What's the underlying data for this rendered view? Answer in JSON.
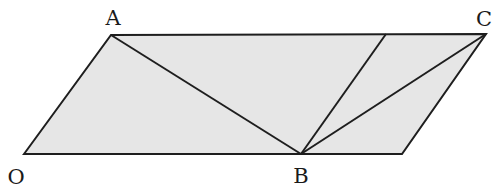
{
  "diagram": {
    "type": "geometry",
    "fill_color": "#e6e6e6",
    "stroke_color": "#1e1e1e",
    "background": "#ffffff",
    "points": {
      "A": {
        "label": "A",
        "x": 111,
        "y": 35,
        "label_x": 113,
        "label_y": 25
      },
      "C": {
        "label": "C",
        "x": 486,
        "y": 34,
        "label_x": 484,
        "label_y": 26
      },
      "O": {
        "label": "O",
        "x": 24,
        "y": 154,
        "label_x": 16,
        "label_y": 184
      },
      "B": {
        "label": "B",
        "x": 301,
        "y": 154,
        "label_x": 301,
        "label_y": 183
      }
    },
    "unlabeled_points": {
      "D_bottom_right": {
        "x": 402,
        "y": 154
      },
      "E_top_inner": {
        "x": 386,
        "y": 34
      }
    },
    "segments": [
      {
        "from": "O",
        "to": "A"
      },
      {
        "from": "A",
        "to": "C"
      },
      {
        "from": "C",
        "to": "D_bottom_right"
      },
      {
        "from": "O",
        "to": "D_bottom_right"
      },
      {
        "from": "A",
        "to": "B"
      },
      {
        "from": "B",
        "to": "E_top_inner"
      },
      {
        "from": "B",
        "to": "C"
      }
    ],
    "labels": [
      "A",
      "C",
      "O",
      "B"
    ]
  }
}
